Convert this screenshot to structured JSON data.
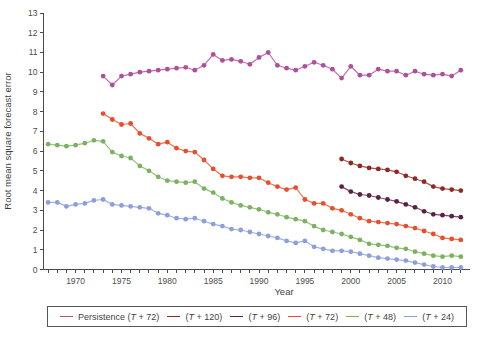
{
  "figure": {
    "background": "#ffffff",
    "axis_color": "#4a4a4a",
    "tick_label_color": "#4d4d4d"
  },
  "chart_data": {
    "type": "line",
    "title": "",
    "xlabel": "Year",
    "ylabel": "Root mean square forecast error",
    "xlim": [
      1966.5,
      2013
    ],
    "ylim": [
      0,
      13
    ],
    "x_major_ticks": [
      1970,
      1975,
      1980,
      1985,
      1990,
      1995,
      2000,
      2005,
      2010
    ],
    "x_minor_tick_start": 1967,
    "x_minor_tick_end": 2012,
    "y_ticks": [
      0,
      1,
      2,
      3,
      4,
      5,
      6,
      7,
      8,
      9,
      10,
      11,
      12,
      13
    ],
    "grid": false,
    "marker": "circle",
    "legend_position": "bottom",
    "series": [
      {
        "name": "Persistence (T + 72)",
        "color": "#ae4f97",
        "start_year": 1973,
        "values": [
          9.8,
          9.35,
          9.8,
          9.9,
          10.0,
          10.05,
          10.1,
          10.15,
          10.2,
          10.25,
          10.1,
          10.35,
          10.9,
          10.6,
          10.65,
          10.55,
          10.4,
          10.75,
          11.0,
          10.35,
          10.2,
          10.1,
          10.3,
          10.5,
          10.35,
          10.15,
          9.7,
          10.3,
          9.85,
          9.85,
          10.15,
          10.05,
          10.05,
          9.85,
          10.05,
          9.9,
          9.85,
          9.9,
          9.8,
          10.1
        ]
      },
      {
        "name": "(T + 120)",
        "color": "#8d2822",
        "start_year": 1999,
        "values": [
          5.6,
          5.4,
          5.25,
          5.15,
          5.1,
          5.05,
          4.95,
          4.75,
          4.6,
          4.45,
          4.2,
          4.1,
          4.05,
          4.0
        ]
      },
      {
        "name": "(T + 96)",
        "color": "#5c2045",
        "start_year": 1999,
        "values": [
          4.2,
          3.95,
          3.8,
          3.75,
          3.65,
          3.55,
          3.45,
          3.3,
          3.15,
          2.95,
          2.8,
          2.75,
          2.7,
          2.65
        ]
      },
      {
        "name": "(T + 72)",
        "color": "#e94e2b",
        "start_year": 1973,
        "values": [
          7.9,
          7.6,
          7.35,
          7.4,
          6.9,
          6.65,
          6.35,
          6.45,
          6.15,
          6.0,
          5.95,
          5.55,
          5.1,
          4.75,
          4.7,
          4.7,
          4.65,
          4.65,
          4.4,
          4.2,
          4.05,
          4.15,
          3.55,
          3.35,
          3.35,
          3.1,
          3.0,
          2.8,
          2.6,
          2.45,
          2.4,
          2.35,
          2.3,
          2.2,
          2.1,
          1.95,
          1.8,
          1.6,
          1.55,
          1.5
        ]
      },
      {
        "name": "(T + 48)",
        "color": "#7cb15f",
        "start_year": 1967,
        "values": [
          6.35,
          6.3,
          6.25,
          6.3,
          6.4,
          6.55,
          6.5,
          5.95,
          5.75,
          5.65,
          5.25,
          5.0,
          4.7,
          4.5,
          4.45,
          4.4,
          4.45,
          4.1,
          3.9,
          3.6,
          3.4,
          3.25,
          3.15,
          3.05,
          2.9,
          2.8,
          2.65,
          2.55,
          2.45,
          2.2,
          2.0,
          1.9,
          1.8,
          1.65,
          1.5,
          1.3,
          1.25,
          1.2,
          1.1,
          1.05,
          0.9,
          0.8,
          0.7,
          0.65,
          0.7,
          0.65
        ]
      },
      {
        "name": "(T + 24)",
        "color": "#8c9edb",
        "start_year": 1967,
        "values": [
          3.4,
          3.4,
          3.2,
          3.3,
          3.35,
          3.5,
          3.55,
          3.3,
          3.25,
          3.2,
          3.15,
          3.1,
          2.85,
          2.75,
          2.6,
          2.55,
          2.6,
          2.45,
          2.3,
          2.2,
          2.05,
          2.0,
          1.9,
          1.8,
          1.7,
          1.6,
          1.45,
          1.35,
          1.45,
          1.15,
          1.05,
          0.95,
          0.95,
          0.9,
          0.8,
          0.7,
          0.6,
          0.55,
          0.5,
          0.45,
          0.35,
          0.25,
          0.15,
          0.1,
          0.1,
          0.1
        ]
      }
    ]
  }
}
